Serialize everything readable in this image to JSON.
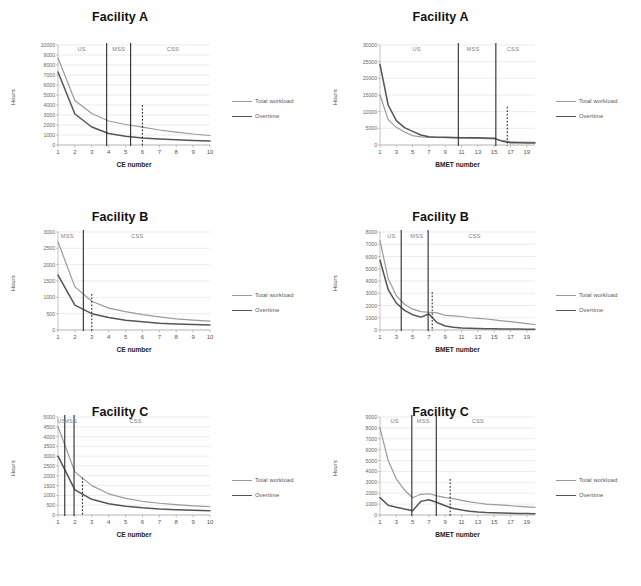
{
  "figure": {
    "legend_labels": {
      "total": "Total workload",
      "overtime": "Overtime"
    },
    "colors": {
      "total_workload": "#9a9a9a",
      "overtime": "#555555",
      "divider": "#2b2b2b",
      "grid": "#d4d4d4"
    },
    "axis_titles": {
      "y": "Hours",
      "x_ce": "CE number",
      "x_bmet": "BMET number"
    },
    "region_names": {
      "us": "US",
      "mss": "MSS",
      "css": "CSS"
    }
  },
  "chart_data": [
    {
      "id": "facility-a-ce",
      "type": "line",
      "title": "Facility A",
      "xlabel": "CE number",
      "ylabel": "Hours",
      "xlim": [
        1,
        10
      ],
      "ylim": [
        0,
        10000
      ],
      "yticks": [
        0,
        1000,
        2000,
        3000,
        4000,
        5000,
        6000,
        7000,
        8000,
        9000,
        10000
      ],
      "xticks": [
        1,
        2,
        3,
        4,
        5,
        6,
        7,
        8,
        9,
        10
      ],
      "grid": true,
      "legend_position": "right",
      "x": [
        1,
        2,
        3,
        4,
        5,
        6,
        7,
        8,
        9,
        10
      ],
      "series": [
        {
          "name": "Total workload",
          "values": [
            8700,
            4450,
            3150,
            2400,
            2050,
            1780,
            1500,
            1290,
            1100,
            950
          ]
        },
        {
          "name": "Overtime",
          "values": [
            7300,
            3100,
            1800,
            1150,
            880,
            700,
            600,
            520,
            450,
            390
          ]
        }
      ],
      "annotations": [
        {
          "label": "US",
          "type": "region",
          "center_x": 2.4
        },
        {
          "label": "MSS",
          "type": "region",
          "center_x": 4.6
        },
        {
          "label": "CSS",
          "type": "region",
          "center_x": 7.8
        },
        {
          "label": "divider-us-mss",
          "type": "divider-solid",
          "x": 3.88
        },
        {
          "label": "divider-mss-css",
          "type": "divider-solid",
          "x": 5.3
        },
        {
          "label": "target",
          "type": "divider-dotted",
          "x": 6.0,
          "y_top": 4000
        }
      ]
    },
    {
      "id": "facility-a-bmet",
      "type": "line",
      "title": "Facility A",
      "xlabel": "BMET number",
      "ylabel": "Hours",
      "xlim": [
        1,
        20
      ],
      "ylim": [
        0,
        30000
      ],
      "yticks": [
        0,
        5000,
        10000,
        15000,
        20000,
        25000,
        30000
      ],
      "xticks": [
        1,
        3,
        5,
        7,
        9,
        11,
        13,
        15,
        17,
        19
      ],
      "grid": true,
      "legend_position": "right",
      "x": [
        1,
        2,
        3,
        4,
        5,
        6,
        7,
        8,
        9,
        10,
        11,
        12,
        13,
        14,
        15,
        16,
        17,
        18,
        19,
        20
      ],
      "series": [
        {
          "name": "Total workload",
          "values": [
            15000,
            7600,
            5300,
            3900,
            2800,
            2450,
            2300,
            2250,
            2200,
            2150,
            2100,
            2050,
            2000,
            1900,
            1800,
            1300,
            1000,
            900,
            850,
            800
          ]
        },
        {
          "name": "Overtime",
          "values": [
            24200,
            12000,
            7300,
            5200,
            4100,
            3000,
            2500,
            2350,
            2300,
            2250,
            2200,
            2180,
            2150,
            2100,
            2050,
            1100,
            700,
            650,
            620,
            600
          ]
        }
      ],
      "annotations": [
        {
          "label": "US",
          "type": "region",
          "center_x": 5.5
        },
        {
          "label": "MSS",
          "type": "region",
          "center_x": 12.4
        },
        {
          "label": "CSS",
          "type": "region",
          "center_x": 17.3
        },
        {
          "label": "divider-us-mss",
          "type": "divider-solid",
          "x": 10.6
        },
        {
          "label": "divider-mss-css",
          "type": "divider-solid",
          "x": 15.2
        },
        {
          "label": "target",
          "type": "divider-dotted",
          "x": 16.6,
          "y_top": 11500
        }
      ]
    },
    {
      "id": "facility-b-ce",
      "type": "line",
      "title": "Facility B",
      "xlabel": "CE number",
      "ylabel": "Hours",
      "xlim": [
        1,
        10
      ],
      "ylim": [
        0,
        3000
      ],
      "yticks": [
        0,
        500,
        1000,
        1500,
        2000,
        2500,
        3000
      ],
      "xticks": [
        1,
        2,
        3,
        4,
        5,
        6,
        7,
        8,
        9,
        10
      ],
      "grid": true,
      "legend_position": "right",
      "x": [
        1,
        2,
        3,
        4,
        5,
        6,
        7,
        8,
        9,
        10
      ],
      "series": [
        {
          "name": "Total workload",
          "values": [
            2700,
            1320,
            880,
            670,
            560,
            470,
            400,
            340,
            300,
            270
          ]
        },
        {
          "name": "Overtime",
          "values": [
            1680,
            760,
            500,
            380,
            300,
            250,
            210,
            185,
            165,
            150
          ]
        }
      ],
      "annotations": [
        {
          "label": "MSS",
          "type": "region",
          "center_x": 1.55
        },
        {
          "label": "CSS",
          "type": "region",
          "center_x": 5.7
        },
        {
          "label": "divider-mss-css",
          "type": "divider-solid",
          "x": 2.5
        },
        {
          "label": "target",
          "type": "divider-dotted",
          "x": 3.0,
          "y_top": 1100
        }
      ]
    },
    {
      "id": "facility-b-bmet",
      "type": "line",
      "title": "Facility B",
      "xlabel": "BMET number",
      "ylabel": "Hours",
      "xlim": [
        1,
        20
      ],
      "ylim": [
        0,
        8000
      ],
      "yticks": [
        0,
        1000,
        2000,
        3000,
        4000,
        5000,
        6000,
        7000,
        8000
      ],
      "xticks": [
        1,
        3,
        5,
        7,
        9,
        11,
        13,
        15,
        17,
        19
      ],
      "grid": true,
      "legend_position": "right",
      "x": [
        1,
        2,
        3,
        4,
        5,
        6,
        7,
        8,
        9,
        10,
        11,
        12,
        13,
        14,
        15,
        16,
        17,
        18,
        19,
        20
      ],
      "series": [
        {
          "name": "Total workload",
          "values": [
            7300,
            4200,
            2800,
            2100,
            1700,
            1500,
            1450,
            1400,
            1200,
            1150,
            1100,
            1000,
            950,
            900,
            820,
            750,
            680,
            600,
            520,
            450
          ]
        },
        {
          "name": "Overtime",
          "values": [
            5700,
            3300,
            2200,
            1600,
            1250,
            1050,
            1300,
            600,
            330,
            230,
            170,
            140,
            120,
            110,
            100,
            90,
            80,
            75,
            70,
            60
          ]
        }
      ],
      "annotations": [
        {
          "label": "US",
          "type": "region",
          "center_x": 2.4
        },
        {
          "label": "MSS",
          "type": "region",
          "center_x": 5.5
        },
        {
          "label": "CSS",
          "type": "region",
          "center_x": 12.6
        },
        {
          "label": "divider-us-mss",
          "type": "divider-solid",
          "x": 3.6
        },
        {
          "label": "divider-mss-css",
          "type": "divider-solid",
          "x": 6.9
        },
        {
          "label": "target",
          "type": "divider-dotted",
          "x": 7.4,
          "y_top": 3100
        }
      ]
    },
    {
      "id": "facility-c-ce",
      "type": "line",
      "title": "Facility C",
      "xlabel": "CE number",
      "ylabel": "Hours",
      "xlim": [
        1,
        10
      ],
      "ylim": [
        0,
        5000
      ],
      "yticks": [
        0,
        500,
        1000,
        1500,
        2000,
        2500,
        3000,
        3500,
        4000,
        4500,
        5000
      ],
      "xticks": [
        1,
        2,
        3,
        4,
        5,
        6,
        7,
        8,
        9,
        10
      ],
      "grid": true,
      "legend_position": "right",
      "x": [
        1,
        2,
        3,
        4,
        5,
        6,
        7,
        8,
        9,
        10
      ],
      "series": [
        {
          "name": "Total workload",
          "values": [
            4500,
            2200,
            1500,
            1080,
            850,
            700,
            600,
            530,
            470,
            420
          ]
        },
        {
          "name": "Overtime",
          "values": [
            3000,
            1280,
            800,
            570,
            450,
            370,
            310,
            270,
            240,
            215
          ]
        }
      ],
      "annotations": [
        {
          "label": "US",
          "type": "region",
          "center_x": 1.2
        },
        {
          "label": "MSS",
          "type": "region",
          "center_x": 1.75
        },
        {
          "label": "CSS",
          "type": "region",
          "center_x": 5.6
        },
        {
          "label": "divider-us-mss",
          "type": "divider-solid",
          "x": 1.4
        },
        {
          "label": "divider-mss-css",
          "type": "divider-solid",
          "x": 1.95
        },
        {
          "label": "target",
          "type": "divider-dotted",
          "x": 2.45,
          "y_top": 1900
        }
      ]
    },
    {
      "id": "facility-c-bmet",
      "type": "line",
      "title": "Facility C",
      "xlabel": "BMET number",
      "ylabel": "Hours",
      "xlim": [
        1,
        20
      ],
      "ylim": [
        0,
        9000
      ],
      "yticks": [
        0,
        1000,
        2000,
        3000,
        4000,
        5000,
        6000,
        7000,
        8000,
        9000
      ],
      "xticks": [
        1,
        3,
        5,
        7,
        9,
        11,
        13,
        15,
        17,
        19
      ],
      "grid": true,
      "legend_position": "right",
      "x": [
        1,
        2,
        3,
        4,
        5,
        6,
        7,
        8,
        9,
        10,
        11,
        12,
        13,
        14,
        15,
        16,
        17,
        18,
        19,
        20
      ],
      "series": [
        {
          "name": "Total workload",
          "values": [
            8000,
            5000,
            3300,
            2300,
            1580,
            1900,
            1950,
            1750,
            1600,
            1500,
            1350,
            1200,
            1100,
            1000,
            950,
            900,
            850,
            800,
            750,
            700
          ]
        },
        {
          "name": "Overtime",
          "values": [
            1600,
            900,
            720,
            550,
            400,
            1250,
            1400,
            1150,
            850,
            600,
            450,
            350,
            280,
            230,
            200,
            180,
            160,
            145,
            130,
            120
          ]
        }
      ],
      "annotations": [
        {
          "label": "US",
          "type": "region",
          "center_x": 2.8
        },
        {
          "label": "MSS",
          "type": "region",
          "center_x": 6.3
        },
        {
          "label": "CSS",
          "type": "region",
          "center_x": 13.0
        },
        {
          "label": "divider-us-mss",
          "type": "divider-solid",
          "x": 4.9
        },
        {
          "label": "divider-mss-css",
          "type": "divider-solid",
          "x": 7.9
        },
        {
          "label": "target",
          "type": "divider-dotted",
          "x": 9.6,
          "y_top": 3300
        }
      ]
    }
  ]
}
